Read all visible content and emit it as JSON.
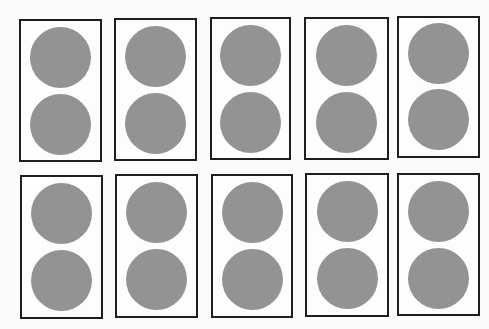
{
  "figure": {
    "rows": 2,
    "columns": 5,
    "circles_per_frame": 2,
    "total_circles": 20,
    "colors": {
      "background": "#fbfbfb",
      "frame_border": "#1e1e1e",
      "frame_fill": "#fdfdfd",
      "circle_fill": "#939393"
    }
  },
  "frames": [
    {
      "id": 1,
      "x": 19,
      "y": 19,
      "w": 83,
      "h": 143
    },
    {
      "id": 2,
      "x": 114,
      "y": 18,
      "w": 83,
      "h": 143
    },
    {
      "id": 3,
      "x": 210,
      "y": 17,
      "w": 81,
      "h": 143
    },
    {
      "id": 4,
      "x": 304,
      "y": 17,
      "w": 85,
      "h": 143
    },
    {
      "id": 5,
      "x": 397,
      "y": 16,
      "w": 83,
      "h": 142
    },
    {
      "id": 6,
      "x": 20,
      "y": 175,
      "w": 83,
      "h": 144
    },
    {
      "id": 7,
      "x": 115,
      "y": 174,
      "w": 83,
      "h": 144
    },
    {
      "id": 8,
      "x": 211,
      "y": 174,
      "w": 82,
      "h": 144
    },
    {
      "id": 9,
      "x": 305,
      "y": 173,
      "w": 84,
      "h": 144
    },
    {
      "id": 10,
      "x": 397,
      "y": 173,
      "w": 83,
      "h": 143
    }
  ]
}
